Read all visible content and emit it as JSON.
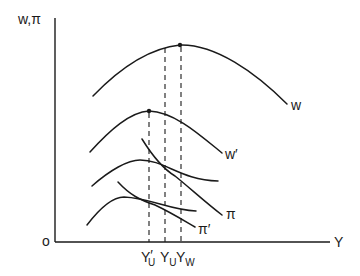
{
  "diagram": {
    "axes": {
      "y_label": "w,π",
      "x_label": "Y",
      "origin_label": "o"
    },
    "curves": [
      {
        "id": "w",
        "label": "w"
      },
      {
        "id": "w_prime",
        "label": "w′"
      },
      {
        "id": "pi",
        "label": "π"
      },
      {
        "id": "pi_prime",
        "label": "π′"
      }
    ],
    "x_ticks": [
      {
        "base": "Y",
        "sub": "U",
        "prime": "′"
      },
      {
        "base": "Y",
        "sub": "U",
        "prime": ""
      },
      {
        "base": "Y",
        "sub": "W",
        "prime": ""
      }
    ]
  }
}
